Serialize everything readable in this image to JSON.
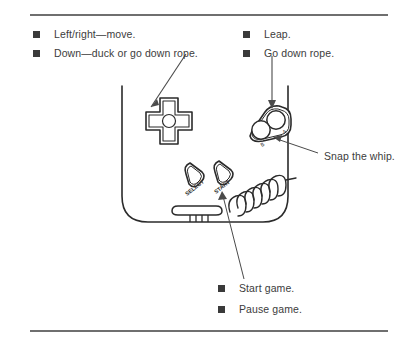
{
  "page": {
    "kind": "instruction-manual-figure",
    "width": 414,
    "height": 347,
    "background_color": "#ffffff",
    "ink_color": "#3c3c3c",
    "bullet_color": "#3a3a3a",
    "rule_color": "#6f6f6f"
  },
  "rules": {
    "top_label": "top-divider",
    "bottom_label": "bottom-divider"
  },
  "legend": {
    "left_column": [
      {
        "bullet": "square-bullet",
        "text": "Left/right—move."
      },
      {
        "bullet": "square-bullet",
        "text": "Down—duck or go down rope."
      }
    ],
    "right_column": [
      {
        "bullet": "square-bullet",
        "text": "Leap."
      },
      {
        "bullet": "square-bullet",
        "text": "Go down rope."
      }
    ],
    "bottom_column": [
      {
        "bullet": "square-bullet",
        "text": "Start game."
      },
      {
        "bullet": "square-bullet",
        "text": "Pause game."
      }
    ]
  },
  "callouts": {
    "snap_the_whip": "Snap the whip."
  },
  "device": {
    "name": "game-boy-controller",
    "dpad": {
      "label": "directional-pad",
      "center": "dpad-center-pivot"
    },
    "action_buttons": [
      {
        "name": "a-button",
        "label": "A"
      },
      {
        "name": "b-button",
        "label": "B"
      }
    ],
    "system_buttons": [
      {
        "name": "select-button",
        "label": "SELECT"
      },
      {
        "name": "start-button",
        "label": "START"
      }
    ],
    "speaker": "speaker-grille",
    "cable": "coiled-link-cable"
  },
  "arrows": [
    {
      "name": "arrow-to-dpad",
      "from_label": "Down—duck or go down rope.",
      "to": "directional-pad"
    },
    {
      "name": "arrow-to-action-buttons",
      "from_label": "Go down rope.",
      "to": "a-button"
    },
    {
      "name": "leader-to-b-button",
      "from_label": "Snap the whip.",
      "to": "b-button"
    },
    {
      "name": "leader-to-start-button",
      "from_label": "Start game.",
      "to": "start-button"
    }
  ]
}
